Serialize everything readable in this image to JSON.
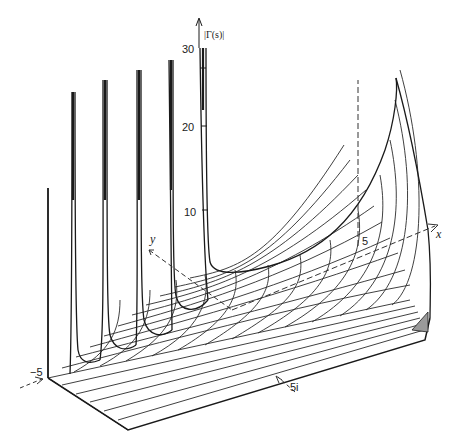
{
  "figure": {
    "title": "|Γ(s)|",
    "axes": {
      "z_label": "|Γ(s)|",
      "x_label": "x",
      "y_label": "y",
      "z_ticks": [
        "30",
        "20",
        "10"
      ],
      "x_tick": "5",
      "x_neg_tick": "−5",
      "y_tick": "5i"
    },
    "colors": {
      "line": "#1a1a1a",
      "grid": "#2a2a2a",
      "axis_dashed": "#333333",
      "shade": "#9a9a9a",
      "background": "#ffffff"
    }
  }
}
